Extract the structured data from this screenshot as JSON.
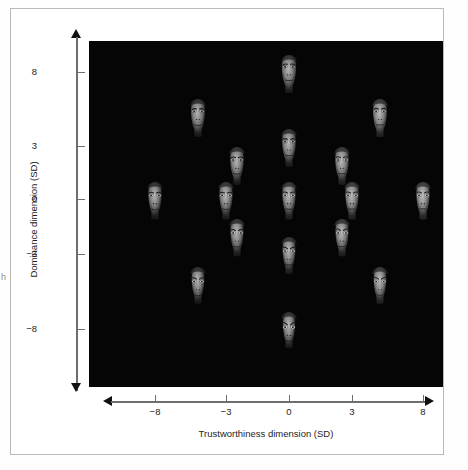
{
  "figure": {
    "edge_artifact_text": "h",
    "background_color": "#ffffff",
    "frame_color": "#b9b9b9",
    "plot_background_color": "#050505"
  },
  "chart_data": {
    "type": "scatter",
    "title": "",
    "xlabel": "Trustworthiness dimension (SD)",
    "ylabel": "Dominance dimension (SD)",
    "xlim": [
      -10,
      10
    ],
    "ylim": [
      -10,
      10
    ],
    "grid": false,
    "legend": null,
    "xticks": [
      "−8",
      "−3",
      "0",
      "3",
      "8"
    ],
    "xtick_values": [
      -8,
      -3,
      0,
      3,
      8
    ],
    "yticks": [
      "8",
      "3",
      "0",
      "−3",
      "−8"
    ],
    "ytick_values": [
      8,
      3,
      0,
      -3,
      -8
    ],
    "marker": "face-image",
    "points": [
      {
        "x": 0,
        "y": 8,
        "label": "face-dominant-neutral-trust",
        "dominance": 1.0,
        "trust": 0.0
      },
      {
        "x": -5,
        "y": 5,
        "label": "face-dominant-untrustworthy",
        "dominance": 0.62,
        "trust": -0.62
      },
      {
        "x": 5,
        "y": 5,
        "label": "face-dominant-trustworthy",
        "dominance": 0.62,
        "trust": 0.62
      },
      {
        "x": 0,
        "y": 3,
        "label": "face-mid-dominant",
        "dominance": 0.38,
        "trust": 0.0
      },
      {
        "x": -2.5,
        "y": 2,
        "label": "face-mid-dominant-untrust",
        "dominance": 0.25,
        "trust": -0.31
      },
      {
        "x": 2.5,
        "y": 2,
        "label": "face-mid-dominant-trust",
        "dominance": 0.25,
        "trust": 0.31
      },
      {
        "x": -8,
        "y": 0,
        "label": "face-untrustworthy-extreme",
        "dominance": 0.0,
        "trust": -1.0
      },
      {
        "x": -3,
        "y": 0,
        "label": "face-untrustworthy-mid",
        "dominance": 0.0,
        "trust": -0.38
      },
      {
        "x": 0,
        "y": 0,
        "label": "face-average",
        "dominance": 0.0,
        "trust": 0.0
      },
      {
        "x": 3,
        "y": 0,
        "label": "face-trustworthy-mid",
        "dominance": 0.0,
        "trust": 0.38
      },
      {
        "x": 8,
        "y": 0,
        "label": "face-trustworthy-extreme",
        "dominance": 0.0,
        "trust": 1.0
      },
      {
        "x": -2.5,
        "y": -2,
        "label": "face-mid-submissive-untrust",
        "dominance": -0.25,
        "trust": -0.31
      },
      {
        "x": 2.5,
        "y": -2,
        "label": "face-mid-submissive-trust",
        "dominance": -0.25,
        "trust": 0.31
      },
      {
        "x": 0,
        "y": -3,
        "label": "face-mid-submissive",
        "dominance": -0.38,
        "trust": 0.0
      },
      {
        "x": -5,
        "y": -5,
        "label": "face-submissive-untrust",
        "dominance": -0.62,
        "trust": -0.62
      },
      {
        "x": 5,
        "y": -5,
        "label": "face-submissive-trust",
        "dominance": -0.62,
        "trust": 0.62
      },
      {
        "x": 0,
        "y": -8,
        "label": "face-submissive-neutral",
        "dominance": -1.0,
        "trust": 0.0
      }
    ]
  }
}
